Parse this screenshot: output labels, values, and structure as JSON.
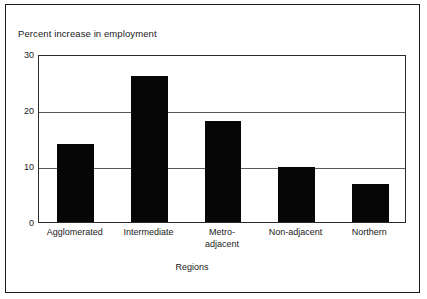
{
  "chart_data": {
    "type": "bar",
    "title": "Percent increase in employment",
    "xlabel": "Regions",
    "ylabel": "",
    "categories": [
      "Agglomerated",
      "Intermediate",
      "Metro-adjacent",
      "Non-adjacent",
      "Northern"
    ],
    "category_lines": [
      [
        "Agglomerated"
      ],
      [
        "Intermediate"
      ],
      [
        "Metro-",
        "adjacent"
      ],
      [
        "Non-adjacent"
      ],
      [
        "Northern"
      ]
    ],
    "values": [
      14,
      26,
      18,
      9.8,
      6.7
    ],
    "ylim": [
      0,
      30
    ],
    "yticks": [
      0,
      10,
      20,
      30
    ],
    "ytick_labels": [
      "0",
      "10",
      "20",
      "30"
    ],
    "grid": true,
    "gridlines_at": [
      10,
      20
    ],
    "legend": null,
    "bar_color": "#060606",
    "axis_color": "#2b2b2b",
    "background": "#ffffff"
  },
  "figure": {
    "frame_color": "#1a1a1a"
  }
}
